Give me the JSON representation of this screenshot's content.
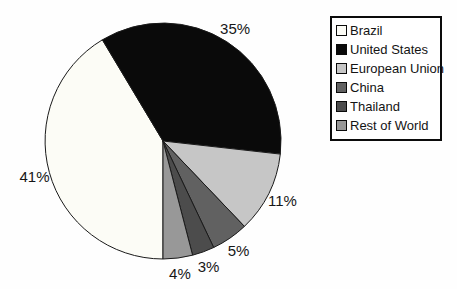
{
  "chart_data": {
    "type": "pie",
    "title": "",
    "start_angle_deg": 180,
    "direction": "clockwise",
    "legend_position": "right",
    "outline_color": "#1a1a1a",
    "background_color": "#fefefe",
    "legend_background": "#ffffff",
    "legend_border_color": "#0b0b0b",
    "slices": [
      {
        "label": "Brazil",
        "value": 41,
        "display_label": "41%",
        "color": "#fcfcf6"
      },
      {
        "label": "United States",
        "value": 35,
        "display_label": "35%",
        "color": "#0a0a0a"
      },
      {
        "label": "European Union",
        "value": 11,
        "display_label": "11%",
        "color": "#c6c6c6"
      },
      {
        "label": "China",
        "value": 5,
        "display_label": "5%",
        "color": "#616161"
      },
      {
        "label": "Thailand",
        "value": 3,
        "display_label": "3%",
        "color": "#4c4c4c"
      },
      {
        "label": "Rest of World",
        "value": 4,
        "display_label": "4%",
        "color": "#989898"
      }
    ]
  }
}
